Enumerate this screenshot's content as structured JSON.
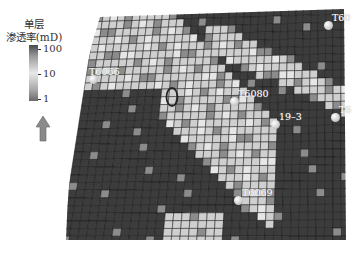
{
  "legend": {
    "title_line1": "单层",
    "title_line2": "渗透率(mD)",
    "ticks": [
      "100",
      "10",
      "1"
    ],
    "north_arrow": "north-arrow"
  },
  "wells": [
    {
      "name": "T6066",
      "label": "T6066",
      "x": 93,
      "y": 79
    },
    {
      "name": "T6080",
      "label": "T6080",
      "x": 234,
      "y": 101
    },
    {
      "name": "19-3",
      "label": "19–3",
      "x": 275,
      "y": 124
    },
    {
      "name": "T60",
      "label": "T60",
      "x": 328,
      "y": 25
    },
    {
      "name": "T6",
      "label": "T6",
      "x": 335,
      "y": 117
    },
    {
      "name": "T6069",
      "label": "T6069",
      "x": 238,
      "y": 200
    }
  ],
  "highlight_ellipse": {
    "x": 172,
    "y": 97,
    "rx": 6,
    "ry": 9
  },
  "grid": {
    "colors": {
      "low": "#3c3c3c",
      "mid": "#8c8c8c",
      "high": "#cfcfcf",
      "veryhigh": "#e6e6e6",
      "line": "#1a1a1a"
    }
  }
}
